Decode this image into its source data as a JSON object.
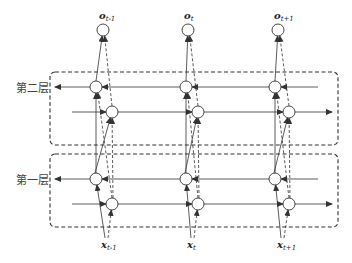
{
  "layers": [
    {
      "label": "第二层",
      "box": {
        "x": 50,
        "y": 72,
        "w": 288,
        "h": 73
      },
      "row_back_y": 87,
      "row_fwd_y": 112
    },
    {
      "label": "第一层",
      "box": {
        "x": 50,
        "y": 154,
        "w": 288,
        "h": 73
      },
      "row_back_y": 179,
      "row_fwd_y": 204
    }
  ],
  "timesteps": [
    {
      "output": {
        "name": "o",
        "sub": "t-1"
      },
      "input": {
        "name": "x",
        "sub": "t-1"
      },
      "x_back": 96,
      "x_fwd": 112,
      "x_out": 103,
      "x_in": 107
    },
    {
      "output": {
        "name": "o",
        "sub": "t"
      },
      "input": {
        "name": "x",
        "sub": "t"
      },
      "x_back": 186,
      "x_fwd": 198,
      "x_out": 188,
      "x_in": 193
    },
    {
      "output": {
        "name": "o",
        "sub": "t+1"
      },
      "input": {
        "name": "x",
        "sub": "t+1"
      },
      "x_back": 275,
      "x_fwd": 289,
      "x_out": 278,
      "x_in": 283
    }
  ],
  "colors": {
    "line": "#333333",
    "box": "#333333",
    "node_fill": "#ffffff"
  }
}
